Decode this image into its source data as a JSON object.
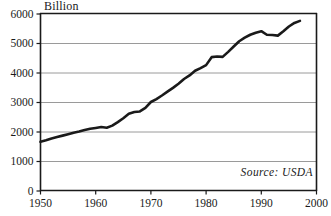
{
  "chart_data": {
    "type": "line",
    "title": "",
    "unit_label": "Billion",
    "xlabel": "",
    "ylabel": "",
    "xlim": [
      1950,
      2000
    ],
    "ylim": [
      0,
      6000
    ],
    "xticks": [
      1950,
      1960,
      1970,
      1980,
      1990,
      2000
    ],
    "xtick_labels": [
      "1950",
      "1960",
      "1970",
      "1980",
      "1990",
      "2000"
    ],
    "yticks": [
      0,
      1000,
      2000,
      3000,
      4000,
      5000,
      6000
    ],
    "ytick_labels": [
      "0",
      "1000",
      "2000",
      "3000",
      "4000",
      "5000",
      "6000"
    ],
    "grid": "horizontal",
    "gridline_values": [
      1000,
      2000,
      3000,
      4000,
      5000
    ],
    "legend": "none",
    "annotations": [
      {
        "text": "Source: USDA",
        "position": "bottom-right",
        "style": "italic"
      }
    ],
    "series": [
      {
        "name": "Billion",
        "color": "#1a1a1a",
        "line_width": 2.6,
        "x": [
          1950,
          1951,
          1952,
          1953,
          1954,
          1955,
          1956,
          1957,
          1958,
          1959,
          1960,
          1961,
          1962,
          1963,
          1964,
          1965,
          1966,
          1967,
          1968,
          1969,
          1970,
          1971,
          1972,
          1973,
          1974,
          1975,
          1976,
          1977,
          1978,
          1979,
          1980,
          1981,
          1982,
          1983,
          1984,
          1985,
          1986,
          1987,
          1988,
          1989,
          1990,
          1991,
          1992,
          1993,
          1994,
          1995,
          1996,
          1997
        ],
        "values": [
          1650,
          1700,
          1760,
          1810,
          1860,
          1910,
          1960,
          2000,
          2050,
          2090,
          2120,
          2150,
          2130,
          2200,
          2320,
          2450,
          2600,
          2660,
          2680,
          2800,
          3000,
          3100,
          3220,
          3350,
          3480,
          3620,
          3780,
          3900,
          4060,
          4150,
          4250,
          4520,
          4540,
          4530,
          4700,
          4880,
          5060,
          5180,
          5280,
          5350,
          5400,
          5280,
          5270,
          5250,
          5400,
          5560,
          5680,
          5750
        ]
      }
    ]
  }
}
